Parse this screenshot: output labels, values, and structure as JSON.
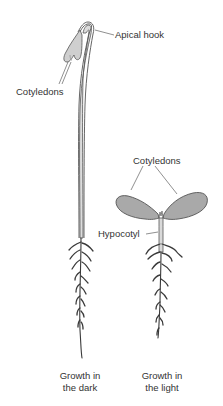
{
  "labels": {
    "apical_hook": "Apical hook",
    "cotyledons_dark": "Cotyledons",
    "cotyledons_light": "Cotyledons",
    "hypocotyl": "Hypocotyl"
  },
  "captions": {
    "dark_line1": "Growth in",
    "dark_line2": "the dark",
    "light_line1": "Growth in",
    "light_line2": "the light"
  },
  "colors": {
    "stem_fill": "#d9d9d9",
    "outline": "#555555",
    "cotyledon_fill": "#a8a8a8",
    "root": "#3a3a3a",
    "text": "#333333"
  }
}
